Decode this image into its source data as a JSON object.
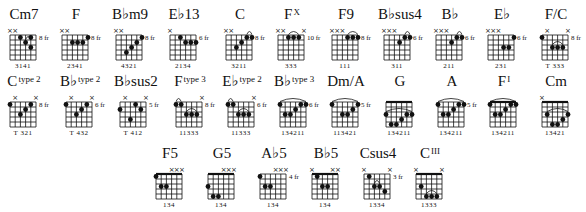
{
  "rows": [
    {
      "y": 5,
      "chords": [
        {
          "x": 4,
          "name": "Cm7",
          "sup": "",
          "fret": "8 fr",
          "mutes": [
            0,
            1
          ],
          "dots": [
            [
              2,
              1
            ],
            [
              4,
              1
            ],
            [
              3,
              2
            ],
            [
              4,
              3
            ]
          ],
          "arcs": [
            [
              3,
              4
            ]
          ],
          "barre": null,
          "fingers": "3141"
        },
        {
          "x": 56,
          "name": "F",
          "sup": "",
          "fret": "8 fr",
          "mutes": [
            0,
            1
          ],
          "dots": [
            [
              5,
              1
            ],
            [
              2,
              2
            ],
            [
              3,
              2
            ],
            [
              4,
              2
            ]
          ],
          "arcs": [],
          "barre": null,
          "fingers": "2341"
        },
        {
          "x": 110,
          "name": "B♭m9",
          "sup": "",
          "fret": "8 fr",
          "mutes": [
            0,
            1
          ],
          "dots": [
            [
              5,
              1
            ],
            [
              4,
              2
            ],
            [
              3,
              3
            ],
            [
              2,
              4
            ]
          ],
          "arcs": [],
          "barre": null,
          "fingers": "4321"
        },
        {
          "x": 164,
          "name": "E♭13",
          "sup": "",
          "fret": "6 fr",
          "mutes": [
            0
          ],
          "dots": [
            [
              2,
              1
            ],
            [
              3,
              2
            ],
            [
              4,
              2
            ],
            [
              5,
              2
            ]
          ],
          "arcs": [],
          "barre": null,
          "fingers": "2134"
        },
        {
          "x": 220,
          "name": "C",
          "sup": "",
          "fret": "8 fr",
          "mutes": [
            0,
            1
          ],
          "dots": [
            [
              2,
              3
            ],
            [
              3,
              2
            ],
            [
              4,
              1
            ],
            [
              5,
              1
            ]
          ],
          "arcs": [
            [
              4,
              5
            ]
          ],
          "barre": null,
          "fingers": "3211"
        },
        {
          "x": 272,
          "name": "F",
          "sup": "X",
          "fret": "10 fr",
          "mutes": [
            0,
            1,
            5
          ],
          "dots": [
            [
              2,
              1
            ],
            [
              3,
              1
            ],
            [
              4,
              1
            ]
          ],
          "arcs": [
            [
              2,
              4
            ]
          ],
          "barre": null,
          "fingers": "333"
        },
        {
          "x": 326,
          "name": "F9",
          "sup": "",
          "fret": "8 fr",
          "mutes": [
            0,
            1,
            2
          ],
          "dots": [
            [
              3,
              1
            ],
            [
              4,
              1
            ],
            [
              5,
              1
            ]
          ],
          "arcs": [
            [
              3,
              5
            ]
          ],
          "barre": null,
          "fingers": "111"
        },
        {
          "x": 378,
          "name": "B♭sus4",
          "sup": "",
          "fret": "6 fr",
          "mutes": [
            0,
            1,
            2
          ],
          "dots": [
            [
              3,
              2
            ],
            [
              4,
              1
            ],
            [
              5,
              1
            ]
          ],
          "arcs": [
            [
              4,
              5
            ]
          ],
          "barre": null,
          "fingers": "311"
        },
        {
          "x": 430,
          "name": "B♭",
          "sup": "",
          "fret": "6 fr",
          "mutes": [
            0,
            1,
            2
          ],
          "dots": [
            [
              3,
              2
            ],
            [
              4,
              1
            ],
            [
              5,
              1
            ]
          ],
          "arcs": [
            [
              4,
              5
            ]
          ],
          "barre": null,
          "fingers": "211"
        },
        {
          "x": 482,
          "name": "E♭",
          "sup": "",
          "fret": "6 fr",
          "mutes": [
            0,
            1,
            2
          ],
          "dots": [
            [
              3,
              3
            ],
            [
              4,
              3
            ],
            [
              5,
              1
            ]
          ],
          "arcs": [],
          "barre": null,
          "fingers": "231"
        },
        {
          "x": 536,
          "name": "F/C",
          "sup": "",
          "fret": "8 fr",
          "mutes": [
            1,
            5
          ],
          "dots": [
            [
              0,
              1
            ],
            [
              2,
              3
            ],
            [
              3,
              3
            ],
            [
              4,
              3
            ]
          ],
          "arcs": [
            [
              2,
              4
            ]
          ],
          "barre": null,
          "fingers": "T 333"
        }
      ]
    },
    {
      "y": 72,
      "chords": [
        {
          "x": 4,
          "name": "C",
          "sup": "type 2",
          "fret": "8 fr",
          "mutes": [
            1,
            5
          ],
          "dots": [
            [
              0,
              1
            ],
            [
              2,
              3
            ],
            [
              3,
              2
            ],
            [
              4,
              1
            ]
          ],
          "arcs": [],
          "barre": null,
          "fingers": "T 321"
        },
        {
          "x": 60,
          "name": "B♭",
          "sup": "type 2",
          "fret": "6 fr",
          "mutes": [
            1,
            5
          ],
          "dots": [
            [
              0,
              1
            ],
            [
              2,
              3
            ],
            [
              3,
              2
            ],
            [
              4,
              1
            ]
          ],
          "arcs": [],
          "barre": null,
          "fingers": "T 432"
        },
        {
          "x": 114,
          "name": "B♭sus2",
          "sup": "",
          "fret": "5 fr",
          "mutes": [
            1,
            5
          ],
          "dots": [
            [
              0,
              2
            ],
            [
              2,
              4
            ],
            [
              3,
              1
            ],
            [
              4,
              2
            ]
          ],
          "arcs": [],
          "barre": null,
          "fingers": "T 412"
        },
        {
          "x": 170,
          "name": "F",
          "sup": "type 3",
          "fret": "8 fr",
          "mutes": [
            5
          ],
          "dots": [
            [
              0,
              1
            ],
            [
              1,
              1
            ],
            [
              2,
              3
            ],
            [
              3,
              3
            ],
            [
              4,
              3
            ]
          ],
          "arcs": [
            [
              0,
              1
            ],
            [
              2,
              4
            ]
          ],
          "barre": null,
          "fingers": "11333"
        },
        {
          "x": 222,
          "name": "E♭",
          "sup": "type 2",
          "fret": "6 fr",
          "mutes": [
            5
          ],
          "dots": [
            [
              0,
              1
            ],
            [
              1,
              1
            ],
            [
              2,
              3
            ],
            [
              3,
              3
            ],
            [
              4,
              3
            ]
          ],
          "arcs": [
            [
              0,
              1
            ],
            [
              2,
              4
            ]
          ],
          "barre": null,
          "fingers": "11333"
        },
        {
          "x": 274,
          "name": "B♭",
          "sup": "type 3",
          "fret": "6 fr",
          "mutes": [],
          "dots": [
            [
              0,
              1
            ],
            [
              1,
              3
            ],
            [
              2,
              3
            ],
            [
              3,
              2
            ],
            [
              4,
              1
            ],
            [
              5,
              1
            ]
          ],
          "arcs": [
            [
              0,
              5
            ]
          ],
          "barre": null,
          "fingers": "134211"
        },
        {
          "x": 326,
          "name": "Dm/A",
          "sup": "",
          "fret": "5 fr",
          "mutes": [],
          "dots": [
            [
              0,
              1
            ],
            [
              2,
              3
            ],
            [
              3,
              3
            ],
            [
              4,
              2
            ],
            [
              5,
              1
            ]
          ],
          "arcs": [
            [
              0,
              5
            ]
          ],
          "barre": null,
          "fingers": "113421"
        },
        {
          "x": 380,
          "name": "G",
          "sup": "",
          "fret": "",
          "nut": true,
          "mutes": [],
          "dots": [
            [
              0,
              3
            ],
            [
              1,
              5
            ],
            [
              2,
              5
            ],
            [
              3,
              4
            ],
            [
              4,
              3
            ],
            [
              5,
              3
            ]
          ],
          "arcs": [
            [
              0,
              5
            ]
          ],
          "barre": null,
          "fingers": "134211"
        },
        {
          "x": 432,
          "name": "A",
          "sup": "",
          "fret": "5 fr",
          "mutes": [],
          "dots": [
            [
              0,
              1
            ],
            [
              1,
              3
            ],
            [
              2,
              3
            ],
            [
              3,
              2
            ],
            [
              4,
              1
            ],
            [
              5,
              1
            ]
          ],
          "arcs": [
            [
              0,
              5
            ]
          ],
          "barre": null,
          "fingers": "134211"
        },
        {
          "x": 484,
          "name": "F",
          "sup": "I",
          "fret": "",
          "nut": true,
          "mutes": [],
          "dots": [
            [
              0,
              1
            ],
            [
              1,
              3
            ],
            [
              2,
              3
            ],
            [
              3,
              2
            ],
            [
              4,
              1
            ],
            [
              5,
              1
            ]
          ],
          "arcs": [
            [
              0,
              5
            ]
          ],
          "barre": null,
          "fingers": "134211"
        },
        {
          "x": 536,
          "name": "Cm",
          "sup": "",
          "fret": "",
          "nut": true,
          "mutes": [
            0
          ],
          "dots": [
            [
              1,
              3
            ],
            [
              2,
              5
            ],
            [
              3,
              5
            ],
            [
              4,
              4
            ],
            [
              5,
              3
            ]
          ],
          "arcs": [
            [
              1,
              5
            ]
          ],
          "barre": null,
          "fingers": "13421"
        }
      ]
    },
    {
      "y": 144,
      "chords": [
        {
          "x": 150,
          "name": "F5",
          "sup": "",
          "fret": "",
          "nut": true,
          "mutes": [
            3,
            4,
            5
          ],
          "dots": [
            [
              0,
              1
            ],
            [
              1,
              3
            ],
            [
              2,
              3
            ]
          ],
          "arcs": [],
          "barre": null,
          "fingers": "134"
        },
        {
          "x": 202,
          "name": "G5",
          "sup": "",
          "fret": "",
          "nut": true,
          "mutes": [
            3,
            4,
            5
          ],
          "dots": [
            [
              0,
              3
            ],
            [
              1,
              5
            ],
            [
              2,
              5
            ]
          ],
          "arcs": [],
          "barre": null,
          "fingers": "134"
        },
        {
          "x": 254,
          "name": "A♭5",
          "sup": "",
          "fret": "4 fr",
          "mutes": [
            3,
            4,
            5
          ],
          "dots": [
            [
              0,
              1
            ],
            [
              1,
              3
            ],
            [
              2,
              3
            ]
          ],
          "arcs": [],
          "barre": null,
          "fingers": "134"
        },
        {
          "x": 306,
          "name": "B♭5",
          "sup": "",
          "fret": "",
          "nut": true,
          "mutes": [
            0,
            4,
            5
          ],
          "dots": [
            [
              1,
              1
            ],
            [
              2,
              3
            ],
            [
              3,
              3
            ]
          ],
          "arcs": [],
          "barre": null,
          "fingers": "134"
        },
        {
          "x": 358,
          "name": "Csus4",
          "sup": "",
          "fret": "3 fr",
          "mutes": [
            0,
            5
          ],
          "dots": [
            [
              1,
              1
            ],
            [
              2,
              3
            ],
            [
              3,
              3
            ],
            [
              4,
              4
            ]
          ],
          "arcs": [
            [
              2,
              3
            ]
          ],
          "barre": null,
          "fingers": "1334"
        },
        {
          "x": 410,
          "name": "C",
          "sup": "III",
          "fret": "",
          "nut": true,
          "mutes": [
            0,
            5
          ],
          "dots": [
            [
              1,
              3
            ],
            [
              2,
              5
            ],
            [
              3,
              5
            ],
            [
              4,
              5
            ]
          ],
          "arcs": [
            [
              2,
              4
            ]
          ],
          "barre": null,
          "fingers": "1333"
        }
      ]
    }
  ],
  "colors": {
    "ink": "#111111",
    "background": "#ffffff"
  }
}
